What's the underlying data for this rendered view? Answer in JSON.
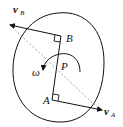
{
  "diagram": {
    "labels": {
      "point_a": "A",
      "point_b": "B",
      "point_p": "P",
      "omega": "ω",
      "velocity_a_main": "v",
      "velocity_a_sub": "A",
      "velocity_b_main": "v",
      "velocity_b_sub": "B"
    },
    "colors": {
      "stroke": "#111111",
      "dashed": "#888888",
      "background": "#ffffff"
    }
  }
}
